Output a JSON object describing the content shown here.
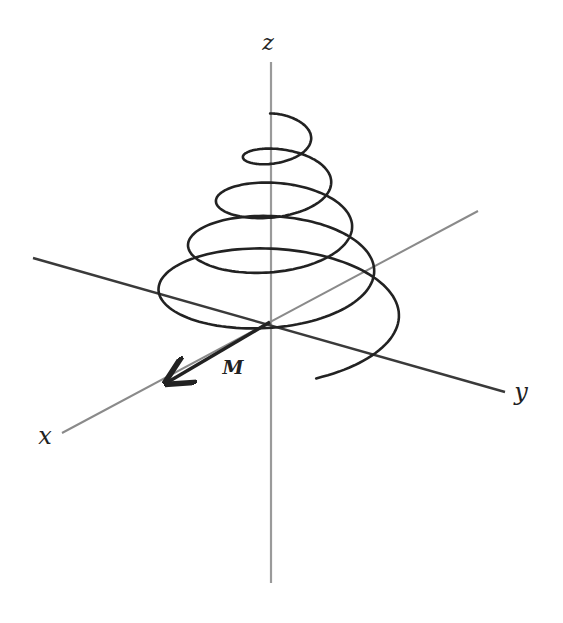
{
  "figure": {
    "type": "3d-axes-helix",
    "labels": {
      "z_axis": "z",
      "y_axis": "y",
      "x_axis": "x",
      "vector": "M"
    },
    "colors": {
      "background": "#ffffff",
      "helix": "#222222",
      "z_axis": "#9a9a9a",
      "x_axis": "#8a8a8a",
      "y_axis": "#3a3a3a",
      "vector": "#222222"
    },
    "geometry": {
      "origin": [
        270,
        322
      ],
      "z_axis": {
        "from": [
          271,
          62
        ],
        "to": [
          271,
          583
        ]
      },
      "y_axis": {
        "from": [
          33,
          258
        ],
        "to": [
          505,
          392
        ]
      },
      "x_axis": {
        "from": [
          62,
          433
        ],
        "to": [
          478,
          211
        ]
      },
      "vector_tip": [
        168,
        382
      ],
      "helix": {
        "turns": 4.6,
        "start_radius_x": 135,
        "start_radius_y": 60,
        "end_radius_x": 18,
        "end_radius_y": 8,
        "start_center": [
          270,
          322
        ],
        "end_center": [
          285,
          118
        ],
        "start_angle_deg": 110
      }
    },
    "label_positions": {
      "z": [
        268,
        50
      ],
      "y": [
        521,
        400
      ],
      "x": [
        45,
        444
      ],
      "M": [
        233,
        374
      ]
    }
  }
}
